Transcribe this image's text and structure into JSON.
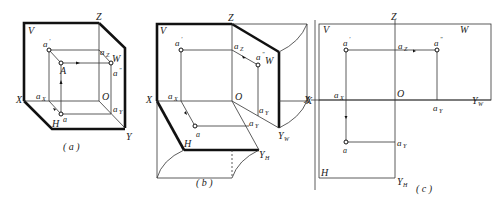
{
  "figure": {
    "panels": [
      {
        "id": "a",
        "caption": "(a)",
        "description": "Isometric view of point A in three-projection-plane system"
      },
      {
        "id": "b",
        "caption": "(b)",
        "description": "Planes H and W rotated open"
      },
      {
        "id": "c",
        "caption": "(c)",
        "description": "Orthographic projection diagram after unfolding"
      }
    ],
    "labels": {
      "V": "V",
      "W": "W",
      "H": "H",
      "X": "X",
      "Y": "Y",
      "Z": "Z",
      "O": "O",
      "A": "A",
      "a": "a",
      "a_prime": "a",
      "a_dprime": "a",
      "a_X": "a",
      "a_Y": "a",
      "a_Z": "a",
      "sub_X": "X",
      "sub_Y": "Y",
      "sub_Z": "Z",
      "Y_W": "Y",
      "Y_H": "Y",
      "sub_W": "W",
      "sub_H": "H",
      "prime": "'",
      "dprime": "\""
    }
  }
}
